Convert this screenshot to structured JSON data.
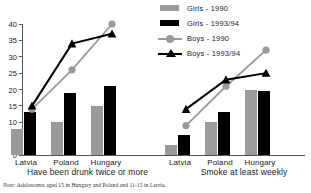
{
  "chart_data": {
    "type": "bar",
    "title": "",
    "note": "Note: Adolescents aged 15 in Hungary and Poland and 11-15 in Latvia.",
    "note_prefix": "Note:",
    "note_body": "Adolescents aged 15 in Hungary and Poland and 11-15 in Latvia.",
    "ylabel": "",
    "xlabel": "",
    "ylim": [
      0,
      40
    ],
    "yticks": [
      0,
      5,
      10,
      15,
      20,
      25,
      30,
      35,
      40
    ],
    "grid": false,
    "legend_position": "top-right",
    "categories": [
      "Latvia",
      "Poland",
      "Hungary"
    ],
    "panels": [
      {
        "name": "Have been drunk twice or more",
        "categories": [
          "Latvia",
          "Poland",
          "Hungary"
        ],
        "series": [
          {
            "name": "Girls - 1990",
            "type": "bar",
            "color": "#9a9a9a",
            "values": [
              8,
              10,
              15
            ]
          },
          {
            "name": "Girls - 1993/94",
            "type": "bar",
            "color": "#000000",
            "values": [
              13,
              19,
              21
            ]
          },
          {
            "name": "Boys - 1990",
            "type": "line",
            "color": "#9a9a9a",
            "marker": "circle",
            "values": [
              14,
              26,
              40
            ]
          },
          {
            "name": "Boys - 1993/94",
            "type": "line",
            "color": "#000000",
            "marker": "triangle",
            "values": [
              15,
              34,
              37
            ]
          }
        ]
      },
      {
        "name": "Smoke at least weekly",
        "categories": [
          "Latvia",
          "Poland",
          "Hungary"
        ],
        "series": [
          {
            "name": "Girls - 1990",
            "type": "bar",
            "color": "#9a9a9a",
            "values": [
              3,
              10,
              20
            ]
          },
          {
            "name": "Girls - 1993/94",
            "type": "bar",
            "color": "#000000",
            "values": [
              6,
              13,
              19.5
            ]
          },
          {
            "name": "Boys - 1990",
            "type": "line",
            "color": "#9a9a9a",
            "marker": "circle",
            "values": [
              9,
              21,
              32
            ]
          },
          {
            "name": "Boys - 1993/94",
            "type": "line",
            "color": "#000000",
            "marker": "triangle",
            "values": [
              14,
              23,
              25
            ]
          }
        ]
      }
    ]
  },
  "legend": {
    "items": [
      {
        "label": "Girls - 1990",
        "key": "bar-gray"
      },
      {
        "label": "Girls - 1993/94",
        "key": "bar-black"
      },
      {
        "label": "Boys - 1990",
        "key": "line-gray-circle"
      },
      {
        "label": "Boys - 1993/94",
        "key": "line-black-triangle"
      }
    ]
  },
  "axis": {
    "yticks": [
      "0",
      "5",
      "10",
      "15",
      "20",
      "25",
      "30",
      "35",
      "40"
    ]
  },
  "panel_titles": {
    "left": "Have been drunk twice or more",
    "right": "Smoke at least weekly"
  },
  "xlabels": {
    "left": [
      "Latvia",
      "Poland",
      "Hungary"
    ],
    "right": [
      "Latvia",
      "Poland",
      "Hungary"
    ]
  },
  "colors": {
    "gray": "#9a9a9a",
    "black": "#000000",
    "axis": "#555555"
  }
}
